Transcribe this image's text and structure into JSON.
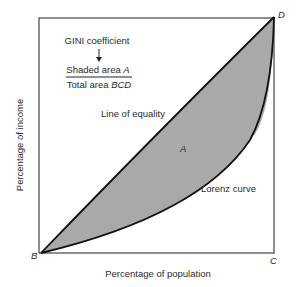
{
  "diagram": {
    "formula": {
      "header": "GINI coefficient",
      "numerator_text": "Shaded area ",
      "numerator_var": "A",
      "denominator_text": "Total area ",
      "denominator_var": "BCD"
    },
    "curves": {
      "equality_label": "Line of equality",
      "lorenz_label": "Lorenz curve",
      "area_label": "A"
    },
    "points": {
      "B": "B",
      "C": "C",
      "D": "D"
    },
    "axes": {
      "xlabel": "Percentage of population",
      "ylabel": "Percentage of income"
    },
    "colors": {
      "shade": "#a9a9a9",
      "line": "#111111",
      "frame": "#444444"
    }
  }
}
